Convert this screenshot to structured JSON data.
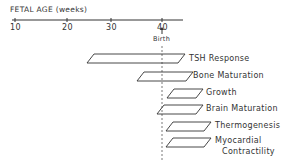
{
  "axis": {
    "title": "FETAL AGE (weeks)",
    "ticks": [
      "10",
      "20",
      "30",
      "40"
    ],
    "birth_label": "Birth"
  },
  "bars": [
    {
      "label": "TSH Response",
      "x1": 87,
      "x2": 178,
      "y": 54
    },
    {
      "label": "Bone Maturation",
      "x1": 137,
      "x2": 186,
      "y": 72
    },
    {
      "label": "Growth",
      "x1": 167,
      "x2": 196,
      "y": 89
    },
    {
      "label": "Brain Maturation",
      "x1": 157,
      "x2": 196,
      "y": 105
    },
    {
      "label": "Thermogenesis",
      "x1": 166,
      "x2": 204,
      "y": 122
    },
    {
      "label": "Myocardial",
      "label2": "Contractility",
      "x1": 166,
      "x2": 204,
      "y": 138
    }
  ]
}
